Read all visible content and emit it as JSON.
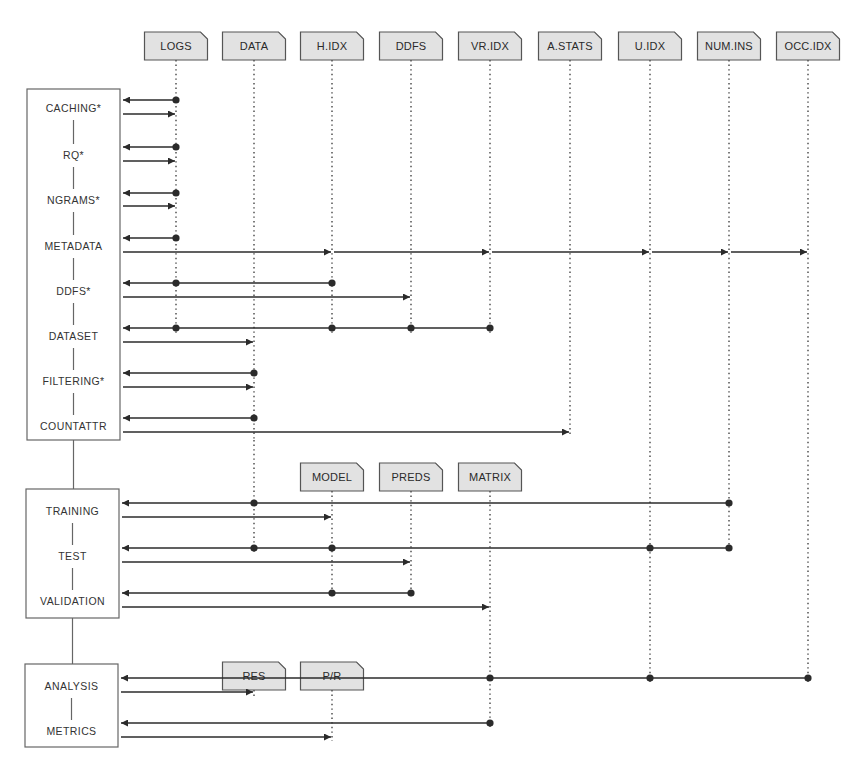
{
  "colors": {
    "ink": "#2b2b2b",
    "header_fill": "#e2e2e2",
    "header_stroke": "#555555",
    "box_stroke": "#666666",
    "lifeline": "#444444",
    "background": "#ffffff"
  },
  "lifelines": {
    "LOGS": 176,
    "DATA": 254,
    "H.IDX": 332,
    "DDFS": 411,
    "VR.IDX": 490,
    "A.STATS": 570,
    "U.IDX": 650,
    "NUM.INS": 729,
    "OCC.IDX": 808
  },
  "header_groups": [
    {
      "y": 32,
      "items": [
        {
          "label": "LOGS",
          "x": 176,
          "line_to": 335
        },
        {
          "label": "DATA",
          "x": 254,
          "line_to": 440
        },
        {
          "label": "H.IDX",
          "x": 332,
          "line_to": 335
        },
        {
          "label": "DDFS",
          "x": 411,
          "line_to": 335
        },
        {
          "label": "VR.IDX",
          "x": 490,
          "line_to": 335
        },
        {
          "label": "A.STATS",
          "x": 570,
          "line_to": 434
        },
        {
          "label": "U.IDX",
          "x": 650,
          "line_to": 682
        },
        {
          "label": "NUM.INS",
          "x": 729,
          "line_to": 552
        },
        {
          "label": "OCC.IDX",
          "x": 808,
          "line_to": 682
        }
      ]
    },
    {
      "y": 463,
      "items": [
        {
          "label": "MODEL",
          "x": 332,
          "line_to": 597
        },
        {
          "label": "PREDS",
          "x": 411,
          "line_to": 597
        },
        {
          "label": "MATRIX",
          "x": 490,
          "line_to": 727
        }
      ]
    },
    {
      "y": 662,
      "items": [
        {
          "label": "RES",
          "x": 254,
          "line_to": 696
        },
        {
          "label": "P/R",
          "x": 332,
          "line_to": 741
        }
      ]
    }
  ],
  "extra_lifelines": [
    {
      "x": 254,
      "from": 440,
      "to": 552
    }
  ],
  "boxes": [
    {
      "name": "preprocessing-stage",
      "x": 27,
      "y": 89,
      "w": 93,
      "h": 351,
      "steps": [
        "CACHING*",
        "RQ*",
        "NGRAMS*",
        "METADATA",
        "DDFS*",
        "DATASET",
        "FILTERING*",
        "COUNTATTR"
      ]
    },
    {
      "name": "model-stage",
      "x": 26,
      "y": 489,
      "w": 93,
      "h": 129,
      "steps": [
        "TRAINING",
        "TEST",
        "VALIDATION"
      ]
    },
    {
      "name": "analysis-stage",
      "x": 25,
      "y": 664,
      "w": 93,
      "h": 83,
      "steps": [
        "ANALYSIS",
        "METRICS"
      ]
    }
  ],
  "messages": [
    {
      "step": "CACHING*",
      "label_y": 108,
      "ret": {
        "y": 100,
        "dots": [
          176
        ]
      },
      "call": {
        "y": 114,
        "to": [
          176
        ]
      }
    },
    {
      "step": "RQ*",
      "label_y": 155,
      "ret": {
        "y": 147,
        "dots": [
          176
        ]
      },
      "call": {
        "y": 161,
        "to": [
          176
        ]
      }
    },
    {
      "step": "NGRAMS*",
      "label_y": 200,
      "ret": {
        "y": 193,
        "dots": [
          176
        ]
      },
      "call": {
        "y": 206,
        "to": [
          176
        ]
      }
    },
    {
      "step": "METADATA",
      "label_y": 246,
      "ret": {
        "y": 238,
        "dots": [
          176
        ]
      },
      "call": {
        "y": 252,
        "to": [
          332,
          490,
          650,
          729,
          808
        ]
      }
    },
    {
      "step": "DDFS*",
      "label_y": 291,
      "ret": {
        "y": 283,
        "dots": [
          176,
          332
        ]
      },
      "call": {
        "y": 297,
        "to": [
          411
        ]
      }
    },
    {
      "step": "DATASET",
      "label_y": 336,
      "ret": {
        "y": 328,
        "dots": [
          176,
          332,
          411,
          490
        ]
      },
      "call": {
        "y": 342,
        "to": [
          254
        ]
      }
    },
    {
      "step": "FILTERING*",
      "label_y": 381,
      "ret": {
        "y": 373,
        "dots": [
          254
        ]
      },
      "call": {
        "y": 387,
        "to": [
          254
        ]
      }
    },
    {
      "step": "COUNTATTR",
      "label_y": 426,
      "ret": {
        "y": 418,
        "dots": [
          254
        ]
      },
      "call": {
        "y": 432,
        "to": [
          570
        ]
      }
    },
    {
      "step": "TRAINING",
      "label_y": 511,
      "ret": {
        "y": 503,
        "dots": [
          254,
          729
        ]
      },
      "call": {
        "y": 517,
        "to": [
          332
        ]
      }
    },
    {
      "step": "TEST",
      "label_y": 556,
      "ret": {
        "y": 548,
        "dots": [
          254,
          332,
          650,
          729
        ]
      },
      "call": {
        "y": 562,
        "to": [
          411
        ]
      }
    },
    {
      "step": "VALIDATION",
      "label_y": 601,
      "ret": {
        "y": 593,
        "dots": [
          332,
          411
        ]
      },
      "call": {
        "y": 607,
        "to": [
          490
        ]
      }
    },
    {
      "step": "ANALYSIS",
      "label_y": 686,
      "ret": {
        "y": 678,
        "dots": [
          490,
          650,
          808
        ]
      },
      "call": {
        "y": 692,
        "to": [
          254
        ]
      }
    },
    {
      "step": "METRICS",
      "label_y": 731,
      "ret": {
        "y": 723,
        "dots": [
          490
        ]
      },
      "call": {
        "y": 737,
        "to": [
          332
        ]
      }
    }
  ]
}
